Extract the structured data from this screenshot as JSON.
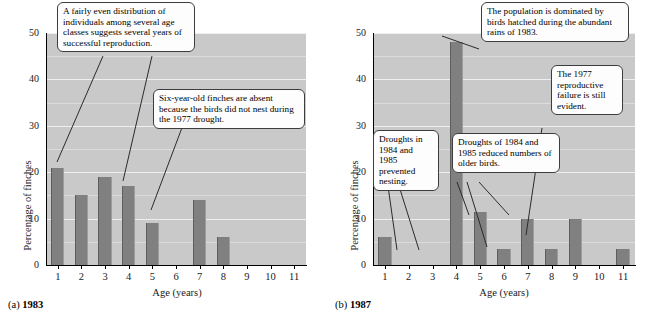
{
  "chart_data": [
    {
      "type": "bar",
      "panel": "a",
      "caption_prefix": "(a)",
      "caption_year": "1983",
      "title": "",
      "xlabel": "Age (years)",
      "ylabel": "Percentage of finches",
      "categories": [
        "1",
        "2",
        "3",
        "4",
        "5",
        "6",
        "7",
        "8",
        "9",
        "10",
        "11"
      ],
      "values": [
        21,
        15,
        19,
        17,
        9,
        0,
        14,
        6,
        0,
        0,
        0
      ],
      "ylim": [
        0,
        50
      ],
      "ytick_labels": [
        "0",
        "10",
        "20",
        "30",
        "40",
        "50"
      ],
      "ytick_values": [
        0,
        10,
        20,
        30,
        40,
        50
      ],
      "yminor_values": [
        5,
        15,
        25,
        35,
        45
      ],
      "grid": true,
      "legend": "none",
      "bar_color": "#808080",
      "plot_bg": "#c9c9c9",
      "annotations": [
        {
          "id": "even-distribution",
          "text": "A fairly even distribution of individuals among several age classes suggests several years of successful reproduction."
        },
        {
          "id": "six-year-absent",
          "text": "Six-year-old finches are absent because the birds did not nest during the 1977 drought."
        }
      ]
    },
    {
      "type": "bar",
      "panel": "b",
      "caption_prefix": "(b)",
      "caption_year": "1987",
      "title": "",
      "xlabel": "Age (years)",
      "ylabel": "Percentage of finches",
      "categories": [
        "1",
        "2",
        "3",
        "4",
        "5",
        "6",
        "7",
        "8",
        "9",
        "10",
        "11"
      ],
      "values": [
        6,
        0,
        0,
        48,
        11.5,
        3.5,
        10,
        3.5,
        10,
        0,
        3.5
      ],
      "ylim": [
        0,
        50
      ],
      "ytick_labels": [
        "0",
        "10",
        "20",
        "30",
        "40",
        "50"
      ],
      "ytick_values": [
        0,
        10,
        20,
        30,
        40,
        50
      ],
      "yminor_values": [
        5,
        15,
        25,
        35,
        45
      ],
      "grid": true,
      "legend": "none",
      "bar_color": "#808080",
      "plot_bg": "#c9c9c9",
      "annotations": [
        {
          "id": "population-dominated",
          "text": "The population is dominated by birds hatched during the abundant rains of 1983."
        },
        {
          "id": "reproductive-failure",
          "text": "The 1977 reproductive failure is still evident."
        },
        {
          "id": "droughts-prevented-nesting",
          "text": "Droughts in 1984 and 1985 prevented nesting."
        },
        {
          "id": "droughts-reduced-older",
          "text": "Droughts of 1984 and 1985 reduced numbers of older birds."
        }
      ]
    }
  ],
  "panel_a": {
    "caption_prefix": "(a)",
    "caption_year": "1983",
    "xlabel": "Age (years)",
    "ylabel": "Percentage of finches",
    "callout_1": "A fairly even distribution of individuals among several age classes suggests several years of successful reproduction.",
    "callout_2": "Six-year-old finches are absent because the birds did not nest during the 1977 drought."
  },
  "panel_b": {
    "caption_prefix": "(b)",
    "caption_year": "1987",
    "xlabel": "Age (years)",
    "ylabel": "Percentage of finches",
    "callout_1": "The population is dominated by birds hatched during the abundant rains of 1983.",
    "callout_2": "The 1977 reproductive failure is still evident.",
    "callout_3": "Droughts in 1984 and 1985 prevented nesting.",
    "callout_4": "Droughts of 1984 and 1985 reduced numbers of older birds."
  }
}
